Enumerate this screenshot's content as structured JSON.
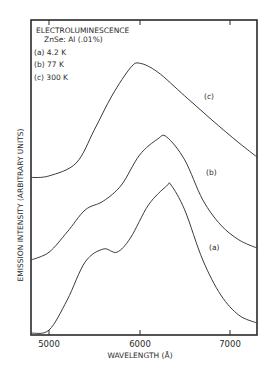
{
  "chart_data": {
    "type": "line",
    "title": "ELECTROLUMINESCENCE",
    "subtitle": "ZnSe: Al (.01%)",
    "xlabel": "WAVELENGTH (Å)",
    "ylabel": "EMISSION INTENSITY (ARBITRARY UNITS)",
    "xlim": [
      4800,
      7300
    ],
    "ylim": [
      0,
      10
    ],
    "x_ticks": [
      5000,
      6000,
      7000
    ],
    "x_tick_labels": [
      "5000",
      "6000",
      "7000"
    ],
    "grid": false,
    "legend": [
      {
        "key": "(a)",
        "label": "4.2 K"
      },
      {
        "key": "(b)",
        "label": "77 K"
      },
      {
        "key": "(c)",
        "label": "300 K"
      }
    ],
    "legend_position": "top-left",
    "series": [
      {
        "name": "(c) 300 K",
        "curve_label": "(c)",
        "x": [
          4800,
          5000,
          5300,
          5500,
          5700,
          5900,
          6000,
          6200,
          6500,
          6800,
          7100,
          7300
        ],
        "values": [
          5.0,
          5.05,
          5.46,
          6.51,
          7.62,
          8.48,
          8.63,
          8.35,
          7.59,
          6.83,
          6.1,
          5.65
        ]
      },
      {
        "name": "(b) 77 K",
        "curve_label": "(b)",
        "x": [
          4800,
          5000,
          5200,
          5400,
          5600,
          5800,
          6000,
          6200,
          6300,
          6500,
          6700,
          6900,
          7100,
          7300
        ],
        "values": [
          2.38,
          2.63,
          3.27,
          3.97,
          4.25,
          4.76,
          5.71,
          6.22,
          6.29,
          5.56,
          4.29,
          3.49,
          3.02,
          2.76
        ]
      },
      {
        "name": "(a) 4.2 K",
        "curve_label": "(a)",
        "x": [
          4800,
          5000,
          5200,
          5400,
          5600,
          5750,
          5900,
          6100,
          6300,
          6350,
          6500,
          6700,
          6900,
          7100,
          7300
        ],
        "values": [
          0.06,
          0.16,
          1.11,
          2.32,
          2.73,
          2.63,
          3.08,
          4.13,
          4.73,
          4.76,
          3.97,
          2.38,
          1.27,
          0.63,
          0.38
        ]
      }
    ]
  },
  "legend_lines": [
    "(a) 4.2  K",
    "(b) 77  K",
    "(c) 300  K"
  ],
  "curve_labels": {
    "a": "(a)",
    "b": "(b)",
    "c": "(c)"
  }
}
